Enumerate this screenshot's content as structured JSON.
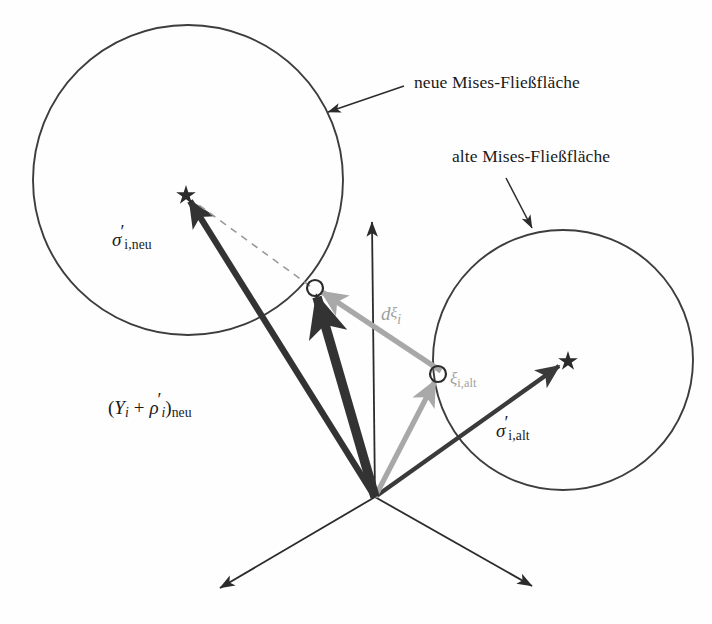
{
  "figure": {
    "background_color": "#fefefe",
    "ink_color": "#2b2b2b",
    "grey_color": "#a8a8a8",
    "dark_vector_color": "#3a3a3a"
  },
  "annotations": {
    "new_surface_label": "neue Mises-Fließfläche",
    "old_surface_label": "alte Mises-Fließfläche"
  },
  "labels": {
    "sigma_neu": {
      "symbol": "σ",
      "prime": "′",
      "subscript": "i,neu",
      "full": "σ′i,neu"
    },
    "sigma_alt": {
      "symbol": "σ",
      "prime": "′",
      "subscript": "i,alt",
      "full": "σ′i,alt"
    },
    "xi_alt": {
      "symbol": "ξ",
      "subscript": "i,alt",
      "full": "ξi,alt"
    },
    "d_xi": {
      "symbol": "d",
      "superscript": "ξ",
      "subscript": "i",
      "full": "dξi"
    },
    "yield_radius": {
      "open_paren": "(",
      "Y": "Y",
      "Y_sub": "i",
      "plus": "+",
      "rho": "ρ",
      "rho_prime": "′",
      "rho_sub": "i",
      "close_paren": ")",
      "outer_sub": "neu",
      "full": "(Yi + ρ′i)neu"
    }
  },
  "geometry": {
    "origin": {
      "x": 375,
      "y": 497
    },
    "circles": [
      {
        "name": "neue-mises-fliessflaeche",
        "cx": 188,
        "cy": 180,
        "r": 155
      },
      {
        "name": "alte-mises-fliessflaeche",
        "cx": 563,
        "cy": 360,
        "r": 130
      }
    ],
    "axes": [
      {
        "name": "axis-up",
        "x2": 372,
        "y2": 218
      },
      {
        "name": "axis-lower-left",
        "x2": 215,
        "y2": 592
      },
      {
        "name": "axis-lower-right",
        "x2": 537,
        "y2": 590
      }
    ],
    "markers": [
      {
        "name": "star-sigma-neu",
        "x": 186,
        "y": 194
      },
      {
        "name": "star-sigma-alt",
        "x": 568,
        "y": 360
      },
      {
        "name": "circle-xi-neu",
        "x": 315,
        "y": 288
      },
      {
        "name": "circle-xi-alt",
        "x": 438,
        "y": 374
      }
    ],
    "leader_lines": [
      {
        "name": "leader-new-surface",
        "x1": 404,
        "y1": 86,
        "x2": 325,
        "y2": 113
      },
      {
        "name": "leader-old-surface",
        "x1": 506,
        "y1": 178,
        "x2": 534,
        "y2": 233
      }
    ]
  }
}
